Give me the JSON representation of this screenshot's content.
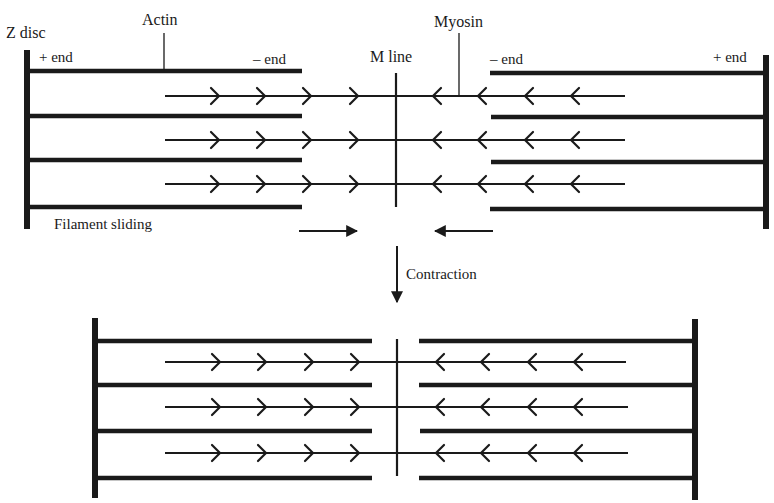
{
  "diagram": {
    "labels": {
      "z_disc": "Z disc",
      "actin": "Actin",
      "myosin": "Myosin",
      "m_line": "M line",
      "plus_end_left": "+ end",
      "minus_end_left": "– end",
      "minus_end_right": "– end",
      "plus_end_right": "+ end",
      "filament_sliding": "Filament sliding",
      "contraction": "Contraction"
    },
    "colors": {
      "stroke": "#1a1a1a",
      "background": "#ffffff"
    },
    "states": [
      {
        "name": "relaxed",
        "z_disc_left_x": 27,
        "z_disc_right_x": 766,
        "m_line_x": 396,
        "actin_rows_y": [
          71,
          116,
          160,
          207
        ],
        "myosin_rows_y": [
          96,
          140,
          184
        ],
        "actin_left_end_x": 302,
        "actin_right_start_x": 490,
        "myosin_x_range": [
          165,
          625
        ]
      },
      {
        "name": "contracted",
        "z_disc_left_x": 95,
        "z_disc_right_x": 695,
        "m_line_x": 397,
        "actin_rows_y": [
          341,
          385,
          430,
          476
        ],
        "myosin_rows_y": [
          362,
          406,
          453
        ],
        "actin_left_end_x": 372,
        "actin_right_start_x": 419,
        "myosin_x_range": [
          165,
          628
        ]
      }
    ]
  }
}
